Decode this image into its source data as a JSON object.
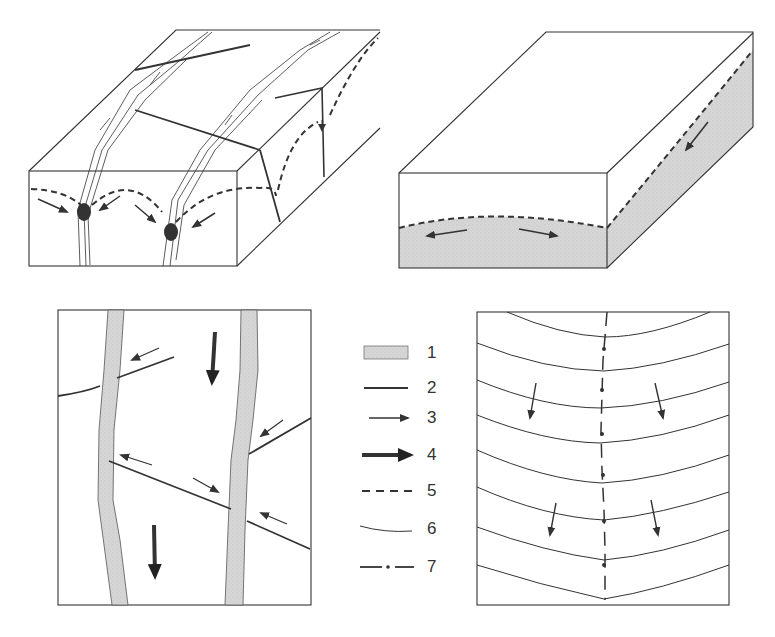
{
  "figure": {
    "panels": [
      {
        "id": "block-diagram-fold-fractures",
        "description": "3D block with fractures, converging dashed fold traces and dark mineralized nodes"
      },
      {
        "id": "block-diagram-shaded",
        "description": "3D block with shaded lower layer, dashed arched contact and divergent arrows"
      },
      {
        "id": "map-view-dykes",
        "description": "Plan view with two shaded vertical bands crossed by faults, slip arrows"
      },
      {
        "id": "map-view-contours",
        "description": "Plan view with curved contour lines and dash-dot axial trace, dip arrows"
      }
    ],
    "colors": {
      "line": "#333333",
      "shade": "#d9d9d9",
      "background": "#ffffff"
    }
  },
  "legend": {
    "items": [
      {
        "number": "1",
        "symbol": "shaded-band"
      },
      {
        "number": "2",
        "symbol": "thick-solid-line"
      },
      {
        "number": "3",
        "symbol": "thin-arrow"
      },
      {
        "number": "4",
        "symbol": "thick-arrow"
      },
      {
        "number": "5",
        "symbol": "dashed-line"
      },
      {
        "number": "6",
        "symbol": "thin-curved-line"
      },
      {
        "number": "7",
        "symbol": "dash-dot-line"
      }
    ]
  }
}
